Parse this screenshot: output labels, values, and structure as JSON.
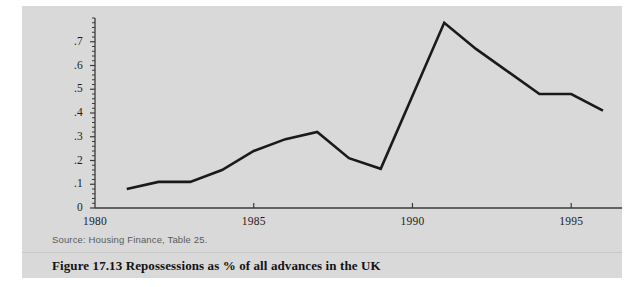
{
  "figure": {
    "caption": "Figure 17.13  Repossessions as % of all advances in the UK",
    "source_note": "Source: Housing Finance, Table 25.",
    "panel_color": "#d9d9d9",
    "line_color": "#1a1a1a",
    "axis_color": "#3a3a3a"
  },
  "chart_data": {
    "type": "line",
    "title": "Repossessions as % of all advances in the UK",
    "xlabel": "",
    "ylabel": "",
    "grid": false,
    "legend": false,
    "x": [
      1981,
      1982,
      1983,
      1984,
      1985,
      1986,
      1987,
      1988,
      1989,
      1991,
      1992,
      1994,
      1995,
      1996
    ],
    "values": [
      0.08,
      0.11,
      0.11,
      0.16,
      0.24,
      0.29,
      0.32,
      0.21,
      0.165,
      0.78,
      0.67,
      0.48,
      0.48,
      0.41
    ],
    "series": [
      {
        "name": "Repossessions as % of all advances",
        "points": [
          {
            "x": 1981,
            "y": 0.08
          },
          {
            "x": 1982,
            "y": 0.11
          },
          {
            "x": 1983,
            "y": 0.11
          },
          {
            "x": 1984,
            "y": 0.16
          },
          {
            "x": 1985,
            "y": 0.24
          },
          {
            "x": 1986,
            "y": 0.29
          },
          {
            "x": 1987,
            "y": 0.32
          },
          {
            "x": 1988,
            "y": 0.21
          },
          {
            "x": 1989,
            "y": 0.165
          },
          {
            "x": 1991,
            "y": 0.78
          },
          {
            "x": 1992,
            "y": 0.67
          },
          {
            "x": 1994,
            "y": 0.48
          },
          {
            "x": 1995,
            "y": 0.48
          },
          {
            "x": 1996,
            "y": 0.41
          }
        ]
      }
    ],
    "xlim": [
      1980,
      1996.6
    ],
    "ylim": [
      0,
      0.8
    ],
    "x_major_ticks": [
      1985,
      1990,
      1995
    ],
    "x_tick_labels": [
      "1980",
      "1985",
      "1990",
      "1995"
    ],
    "x_tick_label_positions": [
      1980,
      1985,
      1990,
      1995
    ],
    "y_tick_labels": [
      "0",
      ".1",
      ".2",
      ".3",
      ".4",
      ".5",
      ".6",
      ".7"
    ],
    "y_tick_values": [
      0,
      0.1,
      0.2,
      0.3,
      0.4,
      0.5,
      0.6,
      0.7
    ],
    "y_minor_tick_step": 0.02
  }
}
